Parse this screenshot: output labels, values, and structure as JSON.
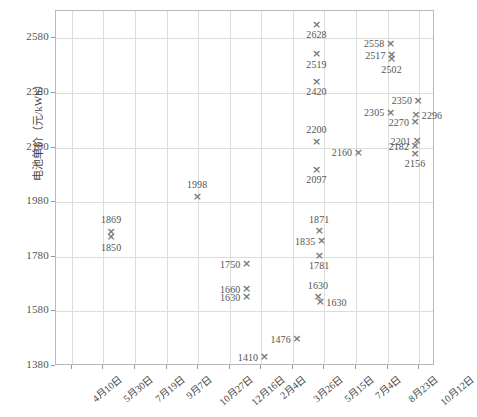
{
  "chart_data": {
    "type": "scatter",
    "title": "",
    "xlabel": "",
    "ylabel": "电池单价（元/kWh）",
    "ylim": [
      1380,
      2680
    ],
    "yticks": [
      1380,
      1580,
      1780,
      1980,
      2180,
      2380,
      2580
    ],
    "xticks": [
      "4月10日",
      "5月30日",
      "7月19日",
      "9月7日",
      "10月27日",
      "12月16日",
      "2月4日",
      "3月26日",
      "5月15日",
      "7月4日",
      "8月23日",
      "10月12日"
    ],
    "grid": true,
    "legend": "none",
    "marker": "x",
    "marker_color": "#7a7a7a",
    "points": [
      {
        "value": 1869,
        "x_frac": 0.148,
        "label": "1869",
        "label_pos": "above"
      },
      {
        "value": 1850,
        "x_frac": 0.148,
        "label": "1850",
        "label_pos": "below"
      },
      {
        "value": 1998,
        "x_frac": 0.375,
        "label": "1998",
        "label_pos": "above"
      },
      {
        "value": 1750,
        "x_frac": 0.505,
        "label": "1750",
        "label_pos": "left"
      },
      {
        "value": 1660,
        "x_frac": 0.505,
        "label": "1660",
        "label_pos": "left"
      },
      {
        "value": 1630,
        "x_frac": 0.505,
        "label": "1630",
        "label_pos": "left"
      },
      {
        "value": 1410,
        "x_frac": 0.552,
        "label": "1410",
        "label_pos": "left"
      },
      {
        "value": 1476,
        "x_frac": 0.638,
        "label": "1476",
        "label_pos": "left"
      },
      {
        "value": 1871,
        "x_frac": 0.697,
        "label": "1871",
        "label_pos": "above"
      },
      {
        "value": 1835,
        "x_frac": 0.703,
        "label": "1835",
        "label_pos": "left"
      },
      {
        "value": 1781,
        "x_frac": 0.697,
        "label": "1781",
        "label_pos": "below"
      },
      {
        "value": 1630,
        "x_frac": 0.694,
        "label": "1630",
        "label_pos": "above"
      },
      {
        "value": 1612,
        "x_frac": 0.7,
        "label": "1630",
        "label_pos": "right"
      },
      {
        "value": 2628,
        "x_frac": 0.69,
        "label": "2628",
        "label_pos": "below"
      },
      {
        "value": 2519,
        "x_frac": 0.69,
        "label": "2519",
        "label_pos": "below"
      },
      {
        "value": 2420,
        "x_frac": 0.69,
        "label": "2420",
        "label_pos": "below"
      },
      {
        "value": 2200,
        "x_frac": 0.69,
        "label": "2200",
        "label_pos": "above"
      },
      {
        "value": 2097,
        "x_frac": 0.69,
        "label": "2097",
        "label_pos": "below"
      },
      {
        "value": 2160,
        "x_frac": 0.8,
        "label": "2160",
        "label_pos": "left"
      },
      {
        "value": 2558,
        "x_frac": 0.885,
        "label": "2558",
        "label_pos": "left"
      },
      {
        "value": 2517,
        "x_frac": 0.888,
        "label": "2517",
        "label_pos": "left"
      },
      {
        "value": 2502,
        "x_frac": 0.888,
        "label": "2502",
        "label_pos": "below"
      },
      {
        "value": 2305,
        "x_frac": 0.885,
        "label": "2305",
        "label_pos": "left"
      },
      {
        "value": 2350,
        "x_frac": 0.958,
        "label": "2350",
        "label_pos": "left"
      },
      {
        "value": 2296,
        "x_frac": 0.952,
        "label": "2296",
        "label_pos": "right"
      },
      {
        "value": 2270,
        "x_frac": 0.95,
        "label": "2270",
        "label_pos": "left"
      },
      {
        "value": 2201,
        "x_frac": 0.955,
        "label": "2201",
        "label_pos": "left"
      },
      {
        "value": 2182,
        "x_frac": 0.95,
        "label": "2182",
        "label_pos": "left"
      },
      {
        "value": 2156,
        "x_frac": 0.95,
        "label": "2156",
        "label_pos": "below"
      }
    ]
  },
  "caption": ""
}
